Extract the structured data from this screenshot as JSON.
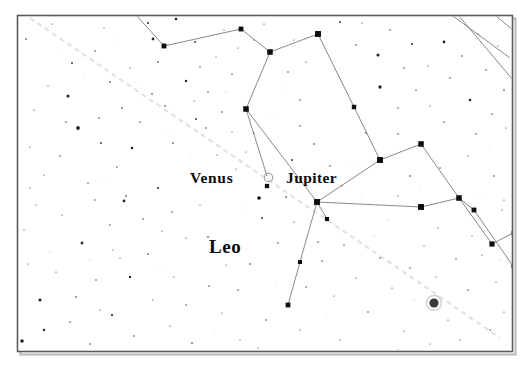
{
  "chart_type": "star-map",
  "frame": {
    "x": 17.5,
    "y": 15.5,
    "width": 495,
    "height": 336,
    "stroke": "#5a5a5a",
    "stroke_width": 1.6,
    "shadow_color": "#bdbdbd",
    "background": "#ffffff"
  },
  "labels": {
    "venus": {
      "text": "Venus",
      "x": 190,
      "y": 183
    },
    "jupiter": {
      "text": "Jupiter",
      "x": 286,
      "y": 183
    },
    "leo": {
      "text": "Leo",
      "x": 209,
      "y": 253
    }
  },
  "planets": [
    {
      "name": "Venus",
      "symbol": "open-circle",
      "x": 268.5,
      "y": 177.5,
      "r": 4.2,
      "stroke": "#9a9a9a",
      "fill": "none"
    },
    {
      "name": "unlabeled-object",
      "symbol": "filled-circle-halo",
      "x": 434,
      "y": 303,
      "r": 4.6,
      "halo_r": 7.5,
      "fill": "#3a3a3a",
      "halo": "#d0d0d0"
    }
  ],
  "ecliptic": {
    "name": "ecliptic",
    "stroke": "#e2e2e2",
    "stroke_width": 2.2,
    "dash": "5 4",
    "points": [
      [
        30,
        18
      ],
      [
        130,
        86
      ],
      [
        230,
        154
      ],
      [
        330,
        222
      ],
      [
        430,
        290
      ],
      [
        500,
        338
      ]
    ]
  },
  "constellation_lines": {
    "stroke": "#6b6b6b",
    "stroke_width": 0.8,
    "segments": [
      [
        [
          137,
          16
        ],
        [
          164,
          46
        ]
      ],
      [
        [
          164,
          46
        ],
        [
          241,
          29
        ]
      ],
      [
        [
          241,
          29
        ],
        [
          270,
          52
        ]
      ],
      [
        [
          270,
          52
        ],
        [
          246,
          109
        ]
      ],
      [
        [
          246,
          109
        ],
        [
          267,
          176
        ]
      ],
      [
        [
          270,
          52
        ],
        [
          318,
          34
        ]
      ],
      [
        [
          318,
          34
        ],
        [
          354,
          107
        ]
      ],
      [
        [
          354,
          107
        ],
        [
          380,
          160
        ]
      ],
      [
        [
          380,
          160
        ],
        [
          317,
          202
        ]
      ],
      [
        [
          246,
          109
        ],
        [
          317,
          202
        ]
      ],
      [
        [
          317,
          202
        ],
        [
          327,
          219
        ]
      ],
      [
        [
          317,
          202
        ],
        [
          300,
          262
        ]
      ],
      [
        [
          300,
          262
        ],
        [
          288,
          305
        ]
      ],
      [
        [
          380,
          160
        ],
        [
          421,
          144
        ]
      ],
      [
        [
          421,
          144
        ],
        [
          459,
          198
        ]
      ],
      [
        [
          459,
          198
        ],
        [
          492,
          244
        ]
      ],
      [
        [
          459,
          198
        ],
        [
          474,
          210
        ]
      ],
      [
        [
          492,
          244
        ],
        [
          513,
          233
        ]
      ],
      [
        [
          474,
          210
        ],
        [
          513,
          266
        ]
      ],
      [
        [
          317,
          202
        ],
        [
          421,
          207
        ]
      ],
      [
        [
          421,
          207
        ],
        [
          459,
          198
        ]
      ],
      [
        [
          453,
          16
        ],
        [
          510,
          58
        ]
      ],
      [
        [
          459,
          16
        ],
        [
          513,
          80
        ]
      ],
      [
        [
          496,
          16
        ],
        [
          513,
          30
        ]
      ]
    ]
  },
  "bright_stars": [
    {
      "x": 164,
      "y": 46,
      "r": 2.6
    },
    {
      "x": 241,
      "y": 29,
      "r": 2.6
    },
    {
      "x": 270,
      "y": 52,
      "r": 3.0
    },
    {
      "x": 318,
      "y": 34,
      "r": 3.2
    },
    {
      "x": 246,
      "y": 109,
      "r": 3.0
    },
    {
      "x": 354,
      "y": 107,
      "r": 2.4
    },
    {
      "x": 380,
      "y": 160,
      "r": 3.2
    },
    {
      "x": 317,
      "y": 202,
      "r": 3.2
    },
    {
      "x": 421,
      "y": 144,
      "r": 3.0
    },
    {
      "x": 459,
      "y": 198,
      "r": 3.0
    },
    {
      "x": 421,
      "y": 207,
      "r": 3.2
    },
    {
      "x": 492,
      "y": 244,
      "r": 2.8
    },
    {
      "x": 474,
      "y": 210,
      "r": 2.6
    },
    {
      "x": 300,
      "y": 262,
      "r": 2.2
    },
    {
      "x": 288,
      "y": 305,
      "r": 2.6
    },
    {
      "x": 327,
      "y": 219,
      "r": 2.2
    },
    {
      "x": 267,
      "y": 186,
      "r": 2.3
    },
    {
      "x": 259,
      "y": 198,
      "r": 1.8
    },
    {
      "x": 513,
      "y": 233,
      "r": 2.0
    },
    {
      "x": 513,
      "y": 266,
      "r": 2.0
    }
  ],
  "field_stars": [
    {
      "x": 26,
      "y": 39,
      "r": 0.8
    },
    {
      "x": 52,
      "y": 24,
      "r": 0.6
    },
    {
      "x": 72,
      "y": 63,
      "r": 0.9
    },
    {
      "x": 68,
      "y": 96,
      "r": 1.6
    },
    {
      "x": 95,
      "y": 51,
      "r": 0.7
    },
    {
      "x": 104,
      "y": 28,
      "r": 0.6
    },
    {
      "x": 110,
      "y": 82,
      "r": 0.8
    },
    {
      "x": 78,
      "y": 128,
      "r": 1.9
    },
    {
      "x": 66,
      "y": 122,
      "r": 0.7
    },
    {
      "x": 99,
      "y": 118,
      "r": 0.7
    },
    {
      "x": 122,
      "y": 108,
      "r": 0.8
    },
    {
      "x": 148,
      "y": 23,
      "r": 1.0
    },
    {
      "x": 153,
      "y": 39,
      "r": 1.4
    },
    {
      "x": 158,
      "y": 62,
      "r": 0.8
    },
    {
      "x": 176,
      "y": 19,
      "r": 1.3
    },
    {
      "x": 186,
      "y": 81,
      "r": 1.2
    },
    {
      "x": 195,
      "y": 42,
      "r": 0.9
    },
    {
      "x": 200,
      "y": 67,
      "r": 0.7
    },
    {
      "x": 208,
      "y": 92,
      "r": 0.7
    },
    {
      "x": 216,
      "y": 57,
      "r": 0.6
    },
    {
      "x": 224,
      "y": 30,
      "r": 0.6
    },
    {
      "x": 232,
      "y": 74,
      "r": 0.7
    },
    {
      "x": 238,
      "y": 48,
      "r": 0.6
    },
    {
      "x": 196,
      "y": 119,
      "r": 0.9
    },
    {
      "x": 173,
      "y": 143,
      "r": 0.8
    },
    {
      "x": 152,
      "y": 94,
      "r": 0.8
    },
    {
      "x": 132,
      "y": 148,
      "r": 1.3
    },
    {
      "x": 117,
      "y": 167,
      "r": 0.7
    },
    {
      "x": 101,
      "y": 143,
      "r": 0.9
    },
    {
      "x": 88,
      "y": 183,
      "r": 0.7
    },
    {
      "x": 60,
      "y": 156,
      "r": 0.7
    },
    {
      "x": 44,
      "y": 175,
      "r": 0.6
    },
    {
      "x": 30,
      "y": 147,
      "r": 0.6
    },
    {
      "x": 36,
      "y": 205,
      "r": 0.6
    },
    {
      "x": 62,
      "y": 215,
      "r": 0.6
    },
    {
      "x": 82,
      "y": 243,
      "r": 1.4
    },
    {
      "x": 95,
      "y": 200,
      "r": 0.7
    },
    {
      "x": 110,
      "y": 225,
      "r": 0.7
    },
    {
      "x": 126,
      "y": 196,
      "r": 0.8
    },
    {
      "x": 143,
      "y": 219,
      "r": 0.7
    },
    {
      "x": 158,
      "y": 188,
      "r": 1.0
    },
    {
      "x": 172,
      "y": 212,
      "r": 0.7
    },
    {
      "x": 186,
      "y": 238,
      "r": 0.6
    },
    {
      "x": 200,
      "y": 205,
      "r": 0.6
    },
    {
      "x": 148,
      "y": 254,
      "r": 0.8
    },
    {
      "x": 130,
      "y": 277,
      "r": 1.2
    },
    {
      "x": 113,
      "y": 250,
      "r": 0.6
    },
    {
      "x": 96,
      "y": 280,
      "r": 0.7
    },
    {
      "x": 76,
      "y": 297,
      "r": 0.8
    },
    {
      "x": 56,
      "y": 272,
      "r": 0.6
    },
    {
      "x": 40,
      "y": 300,
      "r": 1.6
    },
    {
      "x": 28,
      "y": 264,
      "r": 0.6
    },
    {
      "x": 44,
      "y": 330,
      "r": 1.2
    },
    {
      "x": 22,
      "y": 341,
      "r": 1.8
    },
    {
      "x": 70,
      "y": 322,
      "r": 0.7
    },
    {
      "x": 90,
      "y": 344,
      "r": 0.7
    },
    {
      "x": 112,
      "y": 315,
      "r": 1.1
    },
    {
      "x": 134,
      "y": 336,
      "r": 0.7
    },
    {
      "x": 153,
      "y": 300,
      "r": 0.6
    },
    {
      "x": 170,
      "y": 326,
      "r": 0.6
    },
    {
      "x": 120,
      "y": 258,
      "r": 0.6
    },
    {
      "x": 100,
      "y": 310,
      "r": 0.6
    },
    {
      "x": 192,
      "y": 343,
      "r": 0.8
    },
    {
      "x": 186,
      "y": 305,
      "r": 0.7
    },
    {
      "x": 209,
      "y": 286,
      "r": 0.7
    },
    {
      "x": 222,
      "y": 313,
      "r": 0.6
    },
    {
      "x": 240,
      "y": 340,
      "r": 0.6
    },
    {
      "x": 238,
      "y": 290,
      "r": 0.7
    },
    {
      "x": 250,
      "y": 264,
      "r": 0.8
    },
    {
      "x": 226,
      "y": 265,
      "r": 0.6
    },
    {
      "x": 208,
      "y": 237,
      "r": 0.8
    },
    {
      "x": 174,
      "y": 277,
      "r": 0.6
    },
    {
      "x": 124,
      "y": 201,
      "r": 1.4
    },
    {
      "x": 162,
      "y": 231,
      "r": 0.6
    },
    {
      "x": 262,
      "y": 218,
      "r": 0.9
    },
    {
      "x": 278,
      "y": 243,
      "r": 0.7
    },
    {
      "x": 286,
      "y": 197,
      "r": 0.8
    },
    {
      "x": 294,
      "y": 222,
      "r": 0.6
    },
    {
      "x": 306,
      "y": 287,
      "r": 0.7
    },
    {
      "x": 322,
      "y": 261,
      "r": 0.7
    },
    {
      "x": 334,
      "y": 296,
      "r": 0.6
    },
    {
      "x": 344,
      "y": 245,
      "r": 0.7
    },
    {
      "x": 356,
      "y": 278,
      "r": 0.6
    },
    {
      "x": 368,
      "y": 312,
      "r": 0.7
    },
    {
      "x": 380,
      "y": 258,
      "r": 0.7
    },
    {
      "x": 392,
      "y": 288,
      "r": 0.6
    },
    {
      "x": 404,
      "y": 331,
      "r": 0.6
    },
    {
      "x": 410,
      "y": 268,
      "r": 0.7
    },
    {
      "x": 424,
      "y": 246,
      "r": 0.6
    },
    {
      "x": 436,
      "y": 277,
      "r": 0.6
    },
    {
      "x": 448,
      "y": 320,
      "r": 0.6
    },
    {
      "x": 456,
      "y": 259,
      "r": 0.7
    },
    {
      "x": 468,
      "y": 290,
      "r": 0.7
    },
    {
      "x": 482,
      "y": 255,
      "r": 0.6
    },
    {
      "x": 496,
      "y": 282,
      "r": 0.6
    },
    {
      "x": 504,
      "y": 312,
      "r": 0.6
    },
    {
      "x": 490,
      "y": 330,
      "r": 0.7
    },
    {
      "x": 460,
      "y": 340,
      "r": 0.6
    },
    {
      "x": 430,
      "y": 344,
      "r": 0.6
    },
    {
      "x": 398,
      "y": 350,
      "r": 0.5
    },
    {
      "x": 340,
      "y": 340,
      "r": 0.6
    },
    {
      "x": 300,
      "y": 330,
      "r": 0.6
    },
    {
      "x": 266,
      "y": 320,
      "r": 0.7
    },
    {
      "x": 258,
      "y": 348,
      "r": 0.5
    },
    {
      "x": 318,
      "y": 242,
      "r": 0.7
    },
    {
      "x": 292,
      "y": 160,
      "r": 0.9
    },
    {
      "x": 246,
      "y": 152,
      "r": 0.6
    },
    {
      "x": 254,
      "y": 133,
      "r": 0.6
    },
    {
      "x": 236,
      "y": 169,
      "r": 0.6
    },
    {
      "x": 217,
      "y": 155,
      "r": 0.6
    },
    {
      "x": 206,
      "y": 128,
      "r": 0.7
    },
    {
      "x": 222,
      "y": 112,
      "r": 0.7
    },
    {
      "x": 165,
      "y": 106,
      "r": 0.8
    },
    {
      "x": 140,
      "y": 122,
      "r": 0.7
    },
    {
      "x": 314,
      "y": 144,
      "r": 0.8
    },
    {
      "x": 300,
      "y": 126,
      "r": 0.7
    },
    {
      "x": 330,
      "y": 166,
      "r": 0.7
    },
    {
      "x": 342,
      "y": 186,
      "r": 0.6
    },
    {
      "x": 300,
      "y": 100,
      "r": 0.7
    },
    {
      "x": 288,
      "y": 72,
      "r": 0.7
    },
    {
      "x": 306,
      "y": 62,
      "r": 0.6
    },
    {
      "x": 264,
      "y": 24,
      "r": 0.6
    },
    {
      "x": 294,
      "y": 40,
      "r": 0.6
    },
    {
      "x": 340,
      "y": 22,
      "r": 0.9
    },
    {
      "x": 356,
      "y": 45,
      "r": 0.7
    },
    {
      "x": 362,
      "y": 23,
      "r": 0.6
    },
    {
      "x": 378,
      "y": 55,
      "r": 1.6
    },
    {
      "x": 390,
      "y": 30,
      "r": 0.7
    },
    {
      "x": 404,
      "y": 68,
      "r": 0.7
    },
    {
      "x": 412,
      "y": 44,
      "r": 1.0
    },
    {
      "x": 380,
      "y": 87,
      "r": 1.7
    },
    {
      "x": 398,
      "y": 108,
      "r": 0.7
    },
    {
      "x": 416,
      "y": 90,
      "r": 0.7
    },
    {
      "x": 428,
      "y": 66,
      "r": 0.6
    },
    {
      "x": 444,
      "y": 42,
      "r": 1.4
    },
    {
      "x": 450,
      "y": 78,
      "r": 0.7
    },
    {
      "x": 462,
      "y": 56,
      "r": 0.7
    },
    {
      "x": 470,
      "y": 100,
      "r": 1.3
    },
    {
      "x": 478,
      "y": 34,
      "r": 0.6
    },
    {
      "x": 486,
      "y": 70,
      "r": 0.7
    },
    {
      "x": 498,
      "y": 46,
      "r": 0.6
    },
    {
      "x": 504,
      "y": 90,
      "r": 0.8
    },
    {
      "x": 492,
      "y": 114,
      "r": 0.7
    },
    {
      "x": 506,
      "y": 128,
      "r": 0.6
    },
    {
      "x": 476,
      "y": 134,
      "r": 0.7
    },
    {
      "x": 444,
      "y": 122,
      "r": 0.7
    },
    {
      "x": 430,
      "y": 106,
      "r": 0.6
    },
    {
      "x": 398,
      "y": 134,
      "r": 0.7
    },
    {
      "x": 366,
      "y": 133,
      "r": 0.8
    },
    {
      "x": 440,
      "y": 168,
      "r": 0.7
    },
    {
      "x": 410,
      "y": 176,
      "r": 0.8
    },
    {
      "x": 398,
      "y": 196,
      "r": 0.6
    },
    {
      "x": 468,
      "y": 156,
      "r": 0.6
    },
    {
      "x": 494,
      "y": 176,
      "r": 0.7
    },
    {
      "x": 504,
      "y": 200,
      "r": 0.6
    },
    {
      "x": 438,
      "y": 228,
      "r": 0.6
    },
    {
      "x": 472,
      "y": 236,
      "r": 0.6
    },
    {
      "x": 194,
      "y": 101,
      "r": 0.6
    },
    {
      "x": 130,
      "y": 68,
      "r": 0.6
    },
    {
      "x": 48,
      "y": 86,
      "r": 0.6
    },
    {
      "x": 34,
      "y": 110,
      "r": 0.6
    },
    {
      "x": 24,
      "y": 230,
      "r": 0.6
    },
    {
      "x": 30,
      "y": 188,
      "r": 0.6
    },
    {
      "x": 502,
      "y": 210,
      "r": 0.6
    },
    {
      "x": 254,
      "y": 40,
      "r": 0.6
    },
    {
      "x": 232,
      "y": 132,
      "r": 0.6
    }
  ],
  "faint_stars": [
    {
      "x": 58,
      "y": 48,
      "r": 0.5
    },
    {
      "x": 84,
      "y": 74,
      "r": 0.5
    },
    {
      "x": 118,
      "y": 40,
      "r": 0.5
    },
    {
      "x": 142,
      "y": 88,
      "r": 0.5
    },
    {
      "x": 168,
      "y": 128,
      "r": 0.5
    },
    {
      "x": 190,
      "y": 155,
      "r": 0.5
    },
    {
      "x": 210,
      "y": 178,
      "r": 0.5
    },
    {
      "x": 244,
      "y": 208,
      "r": 0.5
    },
    {
      "x": 272,
      "y": 118,
      "r": 0.5
    },
    {
      "x": 284,
      "y": 88,
      "r": 0.5
    },
    {
      "x": 334,
      "y": 70,
      "r": 0.5
    },
    {
      "x": 352,
      "y": 160,
      "r": 0.5
    },
    {
      "x": 388,
      "y": 220,
      "r": 0.5
    },
    {
      "x": 414,
      "y": 300,
      "r": 0.5
    },
    {
      "x": 452,
      "y": 180,
      "r": 0.5
    },
    {
      "x": 490,
      "y": 150,
      "r": 0.5
    },
    {
      "x": 90,
      "y": 260,
      "r": 0.5
    },
    {
      "x": 160,
      "y": 268,
      "r": 0.5
    },
    {
      "x": 214,
      "y": 330,
      "r": 0.5
    },
    {
      "x": 276,
      "y": 282,
      "r": 0.5
    },
    {
      "x": 326,
      "y": 318,
      "r": 0.5
    },
    {
      "x": 374,
      "y": 236,
      "r": 0.5
    },
    {
      "x": 50,
      "y": 252,
      "r": 0.5
    },
    {
      "x": 104,
      "y": 178,
      "r": 0.5
    },
    {
      "x": 226,
      "y": 92,
      "r": 0.5
    },
    {
      "x": 308,
      "y": 176,
      "r": 0.5
    },
    {
      "x": 362,
      "y": 198,
      "r": 0.5
    },
    {
      "x": 420,
      "y": 186,
      "r": 0.5
    },
    {
      "x": 480,
      "y": 196,
      "r": 0.5
    },
    {
      "x": 500,
      "y": 260,
      "r": 0.5
    }
  ]
}
